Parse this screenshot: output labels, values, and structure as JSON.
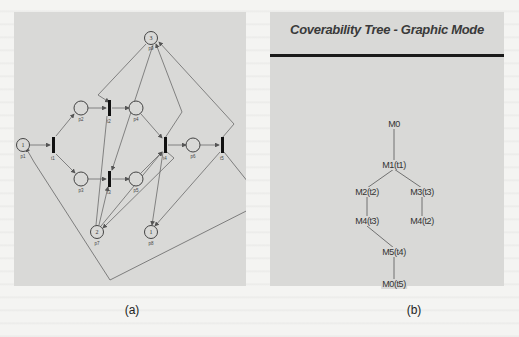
{
  "figure_a": {
    "caption": "(a)",
    "places": [
      {
        "id": "p1",
        "label": "p1",
        "tokens": "1",
        "x": 9,
        "y": 129
      },
      {
        "id": "p2",
        "label": "p2",
        "tokens": "",
        "x": 67,
        "y": 96
      },
      {
        "id": "p3",
        "label": "p3",
        "tokens": "",
        "x": 67,
        "y": 167
      },
      {
        "id": "p4",
        "label": "p4",
        "tokens": "",
        "x": 122,
        "y": 96
      },
      {
        "id": "p5",
        "label": "p5",
        "tokens": "",
        "x": 122,
        "y": 167
      },
      {
        "id": "p6",
        "label": "p6",
        "tokens": "",
        "x": 179,
        "y": 133
      },
      {
        "id": "p7",
        "label": "p7",
        "tokens": "2",
        "x": 83,
        "y": 220
      },
      {
        "id": "p8",
        "label": "p8",
        "tokens": "1",
        "x": 137,
        "y": 220
      },
      {
        "id": "p9",
        "label": "p9",
        "tokens": "3",
        "x": 137,
        "y": 26
      }
    ],
    "transitions": [
      {
        "id": "t1",
        "label": "t1",
        "x": 39,
        "y": 133
      },
      {
        "id": "t2",
        "label": "t2",
        "x": 95,
        "y": 96
      },
      {
        "id": "t3",
        "label": "t3",
        "x": 95,
        "y": 167
      },
      {
        "id": "t4",
        "label": "t4",
        "x": 151,
        "y": 133
      },
      {
        "id": "t5",
        "label": "t5",
        "x": 208,
        "y": 133
      }
    ]
  },
  "figure_b": {
    "title": "Coverability Tree - Graphic Mode",
    "caption": "(b)",
    "nodes": [
      {
        "id": "n0",
        "label": "M0",
        "x": 124,
        "y": 112
      },
      {
        "id": "n1",
        "label": "M1(t1)",
        "x": 124,
        "y": 153
      },
      {
        "id": "n2",
        "label": "M2(t2)",
        "x": 97,
        "y": 180
      },
      {
        "id": "n3",
        "label": "M3(t3)",
        "x": 152,
        "y": 180
      },
      {
        "id": "n4",
        "label": "M4(t3)",
        "x": 97,
        "y": 209
      },
      {
        "id": "n5",
        "label": "M4(t2)",
        "x": 152,
        "y": 209
      },
      {
        "id": "n6",
        "label": "M5(t4)",
        "x": 124,
        "y": 240
      },
      {
        "id": "n7",
        "label": "M0(t5)",
        "x": 124,
        "y": 272
      }
    ],
    "edges": [
      [
        "n0",
        "n1"
      ],
      [
        "n1",
        "n2"
      ],
      [
        "n1",
        "n3"
      ],
      [
        "n2",
        "n4"
      ],
      [
        "n3",
        "n5"
      ],
      [
        "n4",
        "n6"
      ],
      [
        "n6",
        "n7"
      ]
    ]
  }
}
